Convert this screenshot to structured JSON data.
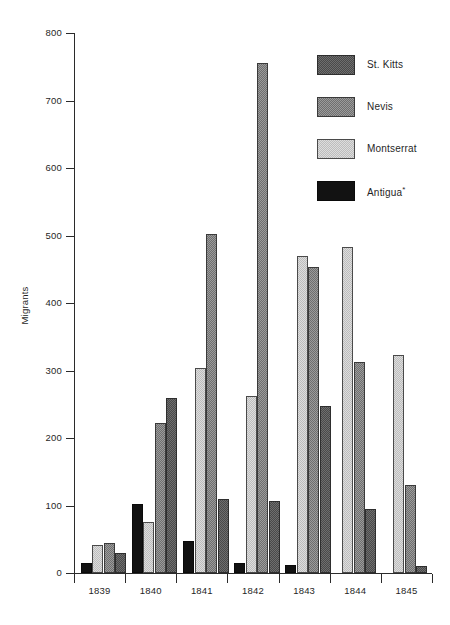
{
  "chart_data": {
    "type": "bar",
    "title": "",
    "xlabel": "",
    "ylabel": "Migrants",
    "categories": [
      "1839",
      "1840",
      "1841",
      "1842",
      "1843",
      "1844",
      "1845"
    ],
    "ylim": [
      0,
      800
    ],
    "yticks": [
      0,
      100,
      200,
      300,
      400,
      500,
      600,
      700,
      800
    ],
    "grid": false,
    "legend_position": "top-right",
    "series": [
      {
        "name": "Antigua*",
        "key": "antigua",
        "color": "#121212",
        "values": [
          15,
          102,
          47,
          15,
          12,
          null,
          null
        ]
      },
      {
        "name": "Montserrat",
        "key": "montserrat",
        "color": "#dddddd",
        "values": [
          42,
          75,
          303,
          262,
          470,
          483,
          323
        ]
      },
      {
        "name": "Nevis",
        "key": "nevis",
        "color": "#9b9b9b",
        "values": [
          45,
          222,
          502,
          755,
          453,
          312,
          131
        ]
      },
      {
        "name": "St. Kitts",
        "key": "stkitts",
        "color": "#6e6e6e",
        "values": [
          30,
          260,
          110,
          107,
          247,
          95,
          10
        ]
      }
    ]
  },
  "legend": {
    "items": [
      {
        "label": "St. Kitts",
        "key": "stkitts"
      },
      {
        "label": "Nevis",
        "key": "nevis"
      },
      {
        "label": "Montserrat",
        "key": "montserrat"
      },
      {
        "label": "Antigua",
        "key": "antigua",
        "superscript": "*"
      }
    ]
  }
}
